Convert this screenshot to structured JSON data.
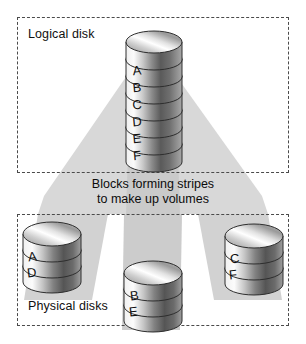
{
  "diagram": {
    "caption_line1": "Blocks forming stripes",
    "caption_line2": "to make up volumes",
    "colors": {
      "fan": "#d6d6d6",
      "fan_beam": "#c2c2c2",
      "dash_border": "#4a4a4a",
      "text": "#111111",
      "cylinder_light": "#f2f2f2",
      "cylinder_dark": "#4a4a4a",
      "cylinder_outline": "#2f2f2f"
    }
  },
  "logical": {
    "label": "Logical disk",
    "stack": {
      "name": "logical-disk-stack",
      "platters": [
        {
          "letter": "A"
        },
        {
          "letter": "B"
        },
        {
          "letter": "C"
        },
        {
          "letter": "D"
        },
        {
          "letter": "E"
        },
        {
          "letter": "F"
        }
      ]
    }
  },
  "physical": {
    "label": "Physical disks",
    "disks": [
      {
        "name": "physical-disk-1",
        "blocks": [
          "A",
          "D"
        ]
      },
      {
        "name": "physical-disk-2",
        "blocks": [
          "B",
          "E"
        ]
      },
      {
        "name": "physical-disk-3",
        "blocks": [
          "C",
          "F"
        ]
      }
    ]
  }
}
